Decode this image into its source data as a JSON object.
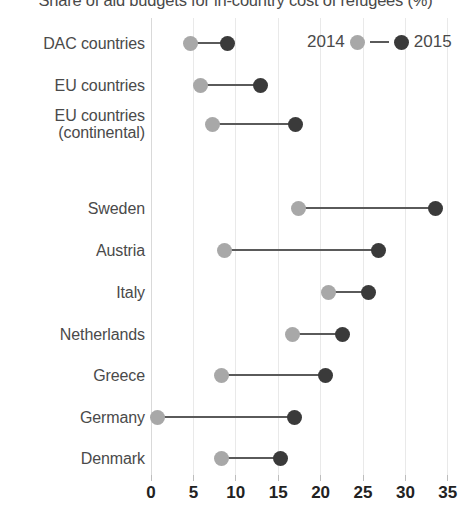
{
  "chart_data": {
    "type": "scatter",
    "subtype": "dumbbell",
    "title": "Share of aid budgets for in-country cost of refugees (%)",
    "xlabel": "",
    "ylabel": "",
    "xlim": [
      0,
      35.5
    ],
    "xticks": [
      0,
      5,
      10,
      15,
      20,
      25,
      30,
      35
    ],
    "xtick_labels": [
      "0",
      "5",
      "10",
      "15",
      "20",
      "25",
      "30",
      "35"
    ],
    "grid": "vertical",
    "legend_position": "top-right",
    "categories": [
      "DAC countries",
      "EU countries",
      "EU countries\n(continental)",
      "",
      "Sweden",
      "Austria",
      "Italy",
      "Netherlands",
      "Greece",
      "Germany",
      "Denmark"
    ],
    "series": [
      {
        "name": "2014",
        "color": "#a8a8a8",
        "values": [
          4.7,
          5.8,
          7.3,
          null,
          17.4,
          8.7,
          20.9,
          16.7,
          8.3,
          0.8,
          8.3
        ]
      },
      {
        "name": "2015",
        "color": "#3a3a3a",
        "values": [
          9.0,
          12.9,
          17.0,
          null,
          33.6,
          26.8,
          25.6,
          22.6,
          20.6,
          16.9,
          15.3
        ]
      }
    ]
  },
  "legend": {
    "left_label": "2014",
    "right_label": "2015"
  }
}
